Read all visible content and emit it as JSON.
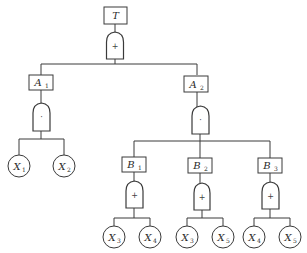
{
  "diagram": {
    "type": "fault-tree",
    "top_event": {
      "id": "T",
      "label": "T",
      "gate": "OR",
      "gate_symbol": "+"
    },
    "events": [
      {
        "id": "A1",
        "letter": "A",
        "sub": "1",
        "parent": "T",
        "gate": "AND",
        "gate_symbol": "·",
        "children": [
          "X1",
          "X2"
        ]
      },
      {
        "id": "A2",
        "letter": "A",
        "sub": "2",
        "parent": "T",
        "gate": "AND",
        "gate_symbol": "·",
        "children": [
          "B1",
          "B2",
          "B3"
        ]
      },
      {
        "id": "B1",
        "letter": "B",
        "sub": "1",
        "parent": "A2",
        "gate": "OR",
        "gate_symbol": "+",
        "children": [
          "X3",
          "X4"
        ]
      },
      {
        "id": "B2",
        "letter": "B",
        "sub": "2",
        "parent": "A2",
        "gate": "OR",
        "gate_symbol": "+",
        "children": [
          "X3",
          "X5"
        ]
      },
      {
        "id": "B3",
        "letter": "B",
        "sub": "3",
        "parent": "A2",
        "gate": "OR",
        "gate_symbol": "+",
        "children": [
          "X4",
          "X5"
        ]
      }
    ],
    "basic_events": [
      {
        "parent": "A1",
        "letter": "X",
        "sub": "1"
      },
      {
        "parent": "A1",
        "letter": "X",
        "sub": "2"
      },
      {
        "parent": "B1",
        "letter": "X",
        "sub": "3"
      },
      {
        "parent": "B1",
        "letter": "X",
        "sub": "4"
      },
      {
        "parent": "B2",
        "letter": "X",
        "sub": "3"
      },
      {
        "parent": "B2",
        "letter": "X",
        "sub": "5"
      },
      {
        "parent": "B3",
        "letter": "X",
        "sub": "4"
      },
      {
        "parent": "B3",
        "letter": "X",
        "sub": "5"
      }
    ]
  }
}
